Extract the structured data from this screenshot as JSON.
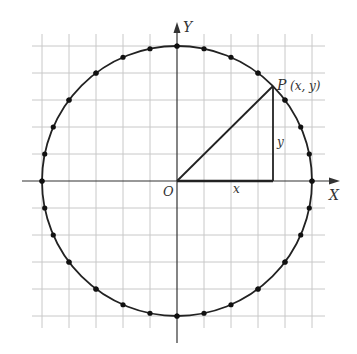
{
  "diagram": {
    "labels": {
      "y_axis": "Y",
      "x_axis": "X",
      "origin": "O",
      "point": "P",
      "point_coords": "(x, y)",
      "x_leg": "x",
      "y_leg": "y"
    },
    "colors": {
      "grid": "#c8c8c8",
      "stroke": "#222222",
      "text": "#333333"
    },
    "geometry": {
      "origin_px": [
        177,
        181
      ],
      "grid_spacing_px": 27,
      "radius_units": 5,
      "point_P_px": [
        273,
        86
      ]
    }
  }
}
